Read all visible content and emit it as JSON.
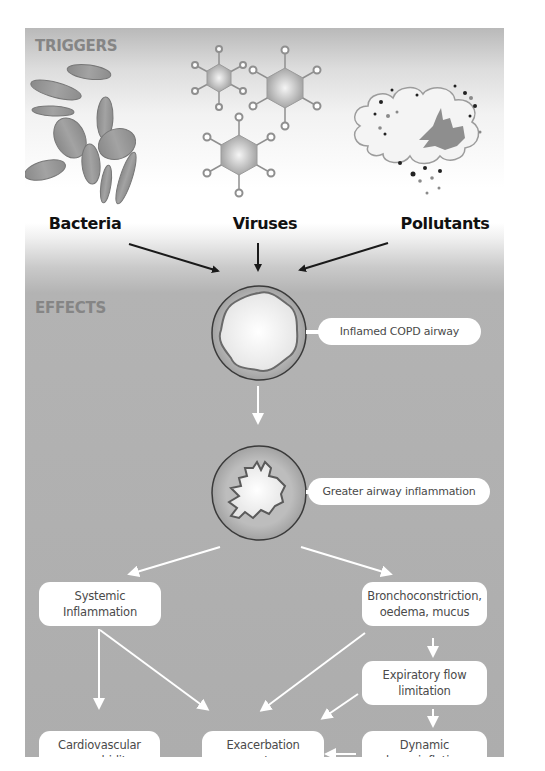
{
  "sections": {
    "triggers_title": "TRIGGERS",
    "effects_title": "EFFECTS"
  },
  "triggers": [
    {
      "label": "Bacteria",
      "icon": "bacteria-icon"
    },
    {
      "label": "Viruses",
      "icon": "virus-icon"
    },
    {
      "label": "Pollutants",
      "icon": "pollutant-cloud-icon"
    }
  ],
  "airways": [
    {
      "label": "Inflamed COPD airway",
      "icon": "inflamed-airway-icon"
    },
    {
      "label": "Greater airway inflammation",
      "icon": "constricted-airway-icon"
    }
  ],
  "effects": {
    "systemic_inflammation": "Systemic\nInflammation",
    "bronchoconstriction": "Bronchoconstriction,\noedema, mucus",
    "expiratory_flow": "Expiratory flow\nlimitation",
    "cardiovascular": "Cardiovascular\ncomorbidity",
    "exacerbation": "Exacerbation\nsymptoms",
    "hyperinflation": "Dynamic\nhyperinflation"
  },
  "colors": {
    "panel_grey": "#adadad",
    "arrow_dark": "#1a1a1a",
    "arrow_light": "#ffffff",
    "box_fill": "#ffffff",
    "section_title": "#858585"
  }
}
